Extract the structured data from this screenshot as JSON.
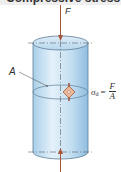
{
  "header": {
    "title": "Compressive stress"
  },
  "diagram": {
    "force_label": "F",
    "area_label": "A",
    "formula": {
      "symbol": "σ",
      "subscript": "d",
      "equals": "=",
      "numerator": "F",
      "denominator": "A"
    },
    "colors": {
      "cylinder_fill": "#c9e3f5",
      "cylinder_edge": "#5f7f98",
      "arrow": "#a8553a",
      "element": "#e8b998",
      "axis": "#444444"
    }
  }
}
